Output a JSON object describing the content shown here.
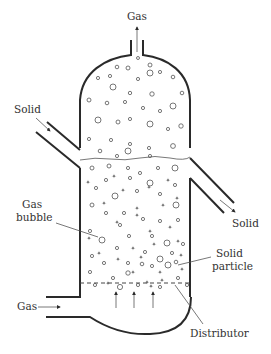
{
  "labels": {
    "gas_outlet": "Gas",
    "solid_inlet": "Solid",
    "solid_outlet": "Solid",
    "gas_bubble_line1": "Gas",
    "gas_bubble_line2": "bubble",
    "solid_particle_line1": "Solid",
    "solid_particle_line2": "particle",
    "gas_inlet": "Gas",
    "distributor": "Distributor"
  },
  "colors": {
    "line": "#2a2a2a",
    "text": "#333333",
    "background": "#ffffff"
  },
  "bubbles_freeboard": [
    [
      138,
      58,
      1.5
    ],
    [
      117,
      67,
      1.8
    ],
    [
      128,
      68,
      2
    ],
    [
      150,
      65,
      2
    ],
    [
      160,
      72,
      1.6
    ],
    [
      98,
      78,
      1.6
    ],
    [
      110,
      76,
      1.6
    ],
    [
      138,
      79,
      1.6
    ],
    [
      150,
      73,
      3
    ],
    [
      173,
      77,
      1.8
    ],
    [
      113,
      87,
      3
    ],
    [
      130,
      93,
      1.7
    ],
    [
      152,
      94,
      2.2
    ],
    [
      182,
      93,
      1.8
    ],
    [
      89,
      100,
      2
    ],
    [
      107,
      103,
      1.8
    ],
    [
      125,
      102,
      1.6
    ],
    [
      143,
      108,
      1.6
    ],
    [
      160,
      111,
      1.6
    ],
    [
      173,
      106,
      3
    ],
    [
      98,
      120,
      3
    ],
    [
      118,
      122,
      2
    ],
    [
      130,
      119,
      1.6
    ],
    [
      150,
      124,
      3
    ],
    [
      168,
      129,
      1.6
    ],
    [
      181,
      126,
      2.2
    ],
    [
      89,
      139,
      1.6
    ],
    [
      111,
      140,
      1.6
    ],
    [
      130,
      144,
      1.6
    ],
    [
      149,
      148,
      1.6
    ],
    [
      173,
      146,
      2.4
    ],
    [
      100,
      151,
      1.8
    ],
    [
      128,
      151,
      3
    ],
    [
      150,
      156,
      1.6
    ],
    [
      117,
      156,
      1.6
    ]
  ],
  "bubbles_bed": [
    [
      92,
      168,
      2
    ],
    [
      109,
      166,
      2
    ],
    [
      128,
      168,
      1.6
    ],
    [
      140,
      173,
      1.6
    ],
    [
      158,
      168,
      1.6
    ],
    [
      175,
      168,
      3
    ],
    [
      106,
      180,
      1.6
    ],
    [
      130,
      178,
      1.6
    ],
    [
      150,
      183,
      3
    ],
    [
      175,
      185,
      1.6
    ],
    [
      96,
      188,
      1.6
    ],
    [
      115,
      196,
      3
    ],
    [
      137,
      191,
      1.6
    ],
    [
      160,
      194,
      1.6
    ],
    [
      176,
      205,
      3
    ],
    [
      92,
      205,
      2
    ],
    [
      106,
      213,
      1.6
    ],
    [
      124,
      213,
      1.6
    ],
    [
      143,
      219,
      1.6
    ],
    [
      160,
      221,
      1.6
    ],
    [
      178,
      220,
      1.6
    ],
    [
      90,
      231,
      1.6
    ],
    [
      120,
      225,
      1.6
    ],
    [
      129,
      236,
      1.6
    ],
    [
      102,
      240,
      3
    ],
    [
      152,
      236,
      1.6
    ],
    [
      167,
      243,
      3
    ],
    [
      183,
      244,
      1.6
    ],
    [
      92,
      256,
      1.6
    ],
    [
      117,
      248,
      1.6
    ],
    [
      145,
      252,
      1.6
    ],
    [
      172,
      253,
      1.6
    ],
    [
      104,
      263,
      1.6
    ],
    [
      128,
      263,
      1.6
    ],
    [
      152,
      266,
      1.6
    ],
    [
      160,
      259,
      3
    ],
    [
      176,
      262,
      1.8
    ],
    [
      90,
      272,
      1.6
    ],
    [
      113,
      278,
      1.6
    ],
    [
      128,
      273,
      2.2
    ],
    [
      142,
      264,
      1.8
    ],
    [
      168,
      265,
      3
    ],
    [
      178,
      278,
      1.6
    ],
    [
      95,
      285,
      1.6
    ],
    [
      138,
      285,
      1.6
    ],
    [
      160,
      287,
      1.6
    ],
    [
      187,
      285,
      1.6
    ],
    [
      120,
      287,
      2.6
    ]
  ],
  "particles_bed": [
    [
      88,
      182
    ],
    [
      114,
      176
    ],
    [
      123,
      190
    ],
    [
      149,
      187
    ],
    [
      168,
      180
    ],
    [
      104,
      203
    ],
    [
      137,
      208
    ],
    [
      163,
      205
    ],
    [
      177,
      198
    ],
    [
      117,
      222
    ],
    [
      137,
      215
    ],
    [
      150,
      231
    ],
    [
      170,
      227
    ],
    [
      89,
      238
    ],
    [
      133,
      248
    ],
    [
      154,
      244
    ],
    [
      178,
      241
    ],
    [
      99,
      253
    ],
    [
      141,
      257
    ],
    [
      160,
      272
    ],
    [
      118,
      259
    ],
    [
      182,
      269
    ],
    [
      133,
      272
    ],
    [
      147,
      282
    ],
    [
      162,
      280
    ],
    [
      181,
      255
    ],
    [
      108,
      283
    ],
    [
      151,
      286
    ]
  ],
  "distributor_arrows": 3
}
